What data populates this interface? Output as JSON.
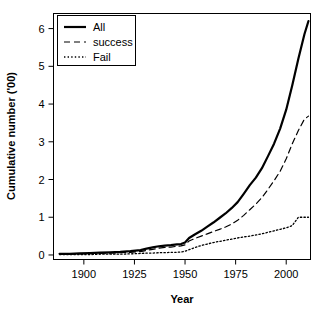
{
  "chart_data": {
    "type": "line",
    "title": "",
    "xlabel": "Year",
    "ylabel": "Cumulative number ('00)",
    "xlim": [
      1885,
      2012
    ],
    "ylim": [
      -0.12,
      6.4
    ],
    "xticks": [
      1900,
      1925,
      1950,
      1975,
      2000
    ],
    "yticks": [
      0,
      1,
      2,
      3,
      4,
      5,
      6
    ],
    "grid": false,
    "legend_position": "top-left",
    "x": [
      1888,
      1893,
      1898,
      1903,
      1908,
      1913,
      1918,
      1923,
      1928,
      1931,
      1934,
      1937,
      1940,
      1943,
      1946,
      1948,
      1950,
      1952,
      1955,
      1958,
      1961,
      1964,
      1967,
      1970,
      1973,
      1976,
      1979,
      1982,
      1985,
      1988,
      1991,
      1994,
      1997,
      2000,
      2003,
      2006,
      2009,
      2011
    ],
    "series": [
      {
        "name": "All",
        "style": "solid",
        "color": "#000000",
        "values": [
          0.03,
          0.03,
          0.04,
          0.05,
          0.06,
          0.07,
          0.08,
          0.1,
          0.13,
          0.17,
          0.2,
          0.23,
          0.25,
          0.26,
          0.28,
          0.29,
          0.33,
          0.45,
          0.55,
          0.64,
          0.75,
          0.86,
          0.98,
          1.1,
          1.24,
          1.4,
          1.62,
          1.85,
          2.05,
          2.3,
          2.62,
          2.95,
          3.35,
          3.85,
          4.5,
          5.2,
          5.85,
          6.2
        ]
      },
      {
        "name": "success",
        "style": "dashed",
        "color": "#000000",
        "values": [
          0.02,
          0.02,
          0.03,
          0.04,
          0.04,
          0.05,
          0.06,
          0.07,
          0.09,
          0.12,
          0.15,
          0.18,
          0.2,
          0.21,
          0.23,
          0.24,
          0.27,
          0.37,
          0.44,
          0.5,
          0.56,
          0.62,
          0.68,
          0.74,
          0.82,
          0.92,
          1.05,
          1.2,
          1.35,
          1.52,
          1.74,
          1.97,
          2.22,
          2.55,
          2.95,
          3.3,
          3.6,
          3.68
        ]
      },
      {
        "name": "Fail",
        "style": "dotted",
        "color": "#000000",
        "values": [
          0.01,
          0.01,
          0.01,
          0.01,
          0.02,
          0.02,
          0.02,
          0.03,
          0.04,
          0.05,
          0.05,
          0.06,
          0.06,
          0.07,
          0.07,
          0.08,
          0.1,
          0.14,
          0.2,
          0.25,
          0.29,
          0.33,
          0.36,
          0.39,
          0.42,
          0.45,
          0.48,
          0.5,
          0.53,
          0.56,
          0.6,
          0.64,
          0.68,
          0.72,
          0.78,
          1.0,
          1.0,
          1.0
        ]
      }
    ],
    "legend": [
      {
        "label": "All",
        "style": "solid"
      },
      {
        "label": "success",
        "style": "dashed"
      },
      {
        "label": "Fail",
        "style": "dotted"
      }
    ]
  }
}
